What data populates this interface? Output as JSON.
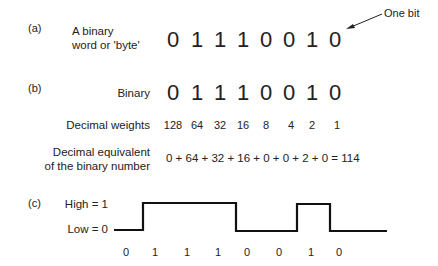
{
  "panel_a": {
    "label": "(a)",
    "description_line1": "A binary",
    "description_line2": "word or 'byte'",
    "bits": [
      "0",
      "1",
      "1",
      "1",
      "0",
      "0",
      "1",
      "0"
    ],
    "annotation": "One bit"
  },
  "panel_b": {
    "label": "(b)",
    "binary_label": "Binary",
    "bits": [
      "0",
      "1",
      "1",
      "1",
      "0",
      "0",
      "1",
      "0"
    ],
    "weights_label": "Decimal weights",
    "weights": [
      "128",
      "64",
      "32",
      "16",
      "8",
      "4",
      "2",
      "1"
    ],
    "equivalent_label_line1": "Decimal equivalent",
    "equivalent_label_line2": "of the binary number",
    "equation": "0 + 64 + 32 + 16 + 0 + 0 + 2 + 0 = 114"
  },
  "panel_c": {
    "label": "(c)",
    "high_label": "High = 1",
    "low_label": "Low = 0",
    "bits": [
      "0",
      "1",
      "1",
      "1",
      "0",
      "0",
      "1",
      "0"
    ]
  }
}
